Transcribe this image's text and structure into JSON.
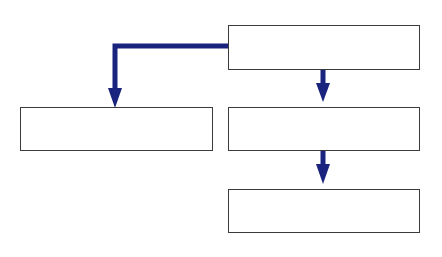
{
  "diagram": {
    "type": "flowchart",
    "colors": {
      "arrow": "#1a237e",
      "box_border": "#3a3a3a",
      "box_fill": "#ffffff",
      "background": "#ffffff"
    },
    "nodes": [
      {
        "id": "top",
        "label": ""
      },
      {
        "id": "left",
        "label": ""
      },
      {
        "id": "middle",
        "label": ""
      },
      {
        "id": "bottom",
        "label": ""
      }
    ],
    "edges": [
      {
        "from": "top",
        "to": "left",
        "style": "elbow"
      },
      {
        "from": "top",
        "to": "middle",
        "style": "straight"
      },
      {
        "from": "middle",
        "to": "bottom",
        "style": "straight"
      }
    ]
  }
}
